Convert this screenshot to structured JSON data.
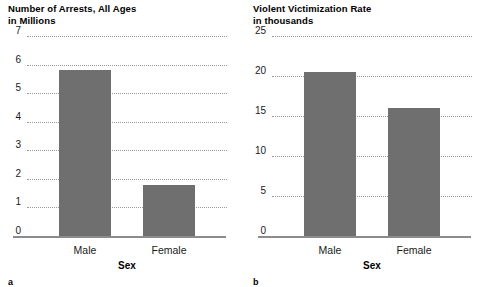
{
  "figure": {
    "panels": [
      {
        "letter": "a",
        "title": "Number of Arrests, All Ages\nin Millions",
        "xlabel": "Sex",
        "categories": [
          "Male",
          "Female"
        ],
        "values": [
          5.8,
          1.8
        ],
        "ticks": [
          "0",
          "1",
          "2",
          "3",
          "4",
          "5",
          "6",
          "7"
        ]
      },
      {
        "letter": "b",
        "title": "Violent Victimization Rate\nin thousands",
        "xlabel": "Sex",
        "categories": [
          "Male",
          "Female"
        ],
        "values": [
          20.5,
          16.0
        ],
        "ticks": [
          "0",
          "5",
          "10",
          "15",
          "20",
          "25"
        ]
      }
    ]
  },
  "chart_data": [
    {
      "type": "bar",
      "title": "Number of Arrests, All Ages in Millions",
      "categories": [
        "Male",
        "Female"
      ],
      "values": [
        5.8,
        1.8
      ],
      "xlabel": "Sex",
      "ylabel": "Number of Arrests, All Ages in Millions",
      "ylim": [
        0,
        7
      ],
      "ytick_values": [
        0,
        1,
        2,
        3,
        4,
        5,
        6,
        7
      ],
      "grid": true,
      "legend": false,
      "panel_label": "a",
      "bar_color": "#6f6f6f"
    },
    {
      "type": "bar",
      "title": "Violent Victimization Rate in thousands",
      "categories": [
        "Male",
        "Female"
      ],
      "values": [
        20.5,
        16.0
      ],
      "xlabel": "Sex",
      "ylabel": "Violent Victimization Rate in thousands",
      "ylim": [
        0,
        25
      ],
      "ytick_values": [
        0,
        5,
        10,
        15,
        20,
        25
      ],
      "grid": true,
      "legend": false,
      "panel_label": "b",
      "bar_color": "#6f6f6f"
    }
  ]
}
